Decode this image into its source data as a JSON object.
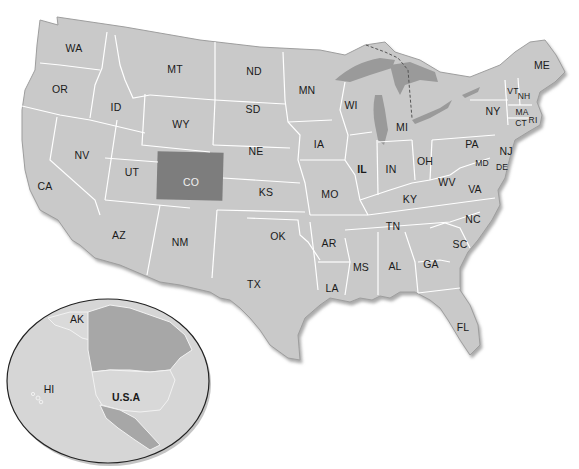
{
  "map": {
    "title": "United States of America",
    "highlighted_state": "CO",
    "colors": {
      "land": "#c9c9c9",
      "highlight": "#7d7d7d",
      "water_lakes": "#9a9a9a",
      "state_border": "#ffffff",
      "coast_shadow": "#a8a8a8",
      "canada": "#a7a7a7",
      "inset_ocean": "#d6d6d6",
      "inset_usa": "#d8d8d8",
      "inset_border": "#222222"
    },
    "states": [
      {
        "abbr": "WA",
        "x": 74,
        "y": 48
      },
      {
        "abbr": "OR",
        "x": 60,
        "y": 89
      },
      {
        "abbr": "ID",
        "x": 116,
        "y": 107
      },
      {
        "abbr": "MT",
        "x": 175,
        "y": 69
      },
      {
        "abbr": "WY",
        "x": 181,
        "y": 124
      },
      {
        "abbr": "NV",
        "x": 82,
        "y": 155
      },
      {
        "abbr": "UT",
        "x": 132,
        "y": 172
      },
      {
        "abbr": "CA",
        "x": 45,
        "y": 186
      },
      {
        "abbr": "AZ",
        "x": 119,
        "y": 235
      },
      {
        "abbr": "NM",
        "x": 180,
        "y": 242
      },
      {
        "abbr": "CO",
        "x": 191,
        "y": 182
      },
      {
        "abbr": "ND",
        "x": 254,
        "y": 71
      },
      {
        "abbr": "SD",
        "x": 253,
        "y": 109
      },
      {
        "abbr": "NE",
        "x": 256,
        "y": 151
      },
      {
        "abbr": "KS",
        "x": 266,
        "y": 192
      },
      {
        "abbr": "OK",
        "x": 278,
        "y": 236
      },
      {
        "abbr": "TX",
        "x": 254,
        "y": 284
      },
      {
        "abbr": "MN",
        "x": 307,
        "y": 90
      },
      {
        "abbr": "IA",
        "x": 319,
        "y": 144
      },
      {
        "abbr": "MO",
        "x": 330,
        "y": 194
      },
      {
        "abbr": "AR",
        "x": 329,
        "y": 243
      },
      {
        "abbr": "LA",
        "x": 332,
        "y": 288
      },
      {
        "abbr": "WI",
        "x": 351,
        "y": 105
      },
      {
        "abbr": "IL",
        "x": 362,
        "y": 169,
        "bold": true
      },
      {
        "abbr": "MI",
        "x": 402,
        "y": 127
      },
      {
        "abbr": "IN",
        "x": 391,
        "y": 169
      },
      {
        "abbr": "OH",
        "x": 425,
        "y": 161
      },
      {
        "abbr": "KY",
        "x": 410,
        "y": 199
      },
      {
        "abbr": "TN",
        "x": 393,
        "y": 226
      },
      {
        "abbr": "MS",
        "x": 361,
        "y": 267
      },
      {
        "abbr": "AL",
        "x": 395,
        "y": 266
      },
      {
        "abbr": "GA",
        "x": 431,
        "y": 264
      },
      {
        "abbr": "FL",
        "x": 463,
        "y": 327
      },
      {
        "abbr": "SC",
        "x": 460,
        "y": 244
      },
      {
        "abbr": "NC",
        "x": 473,
        "y": 219
      },
      {
        "abbr": "VA",
        "x": 475,
        "y": 189
      },
      {
        "abbr": "WV",
        "x": 447,
        "y": 182
      },
      {
        "abbr": "PA",
        "x": 472,
        "y": 144
      },
      {
        "abbr": "NY",
        "x": 493,
        "y": 111
      },
      {
        "abbr": "NJ",
        "x": 506,
        "y": 151
      },
      {
        "abbr": "MD",
        "x": 482,
        "y": 163,
        "small": true
      },
      {
        "abbr": "DE",
        "x": 502,
        "y": 167,
        "small": true
      },
      {
        "abbr": "ME",
        "x": 542,
        "y": 65
      },
      {
        "abbr": "VT",
        "x": 513,
        "y": 91,
        "small": true
      },
      {
        "abbr": "NH",
        "x": 524,
        "y": 96,
        "small": true
      },
      {
        "abbr": "MA",
        "x": 522,
        "y": 112,
        "small": true
      },
      {
        "abbr": "CT",
        "x": 521,
        "y": 123,
        "small": true
      },
      {
        "abbr": "RI",
        "x": 533,
        "y": 120,
        "small": true
      }
    ],
    "inset": {
      "labels": [
        {
          "text": "AK",
          "x": 77,
          "y": 319
        },
        {
          "text": "HI",
          "x": 49,
          "y": 389
        },
        {
          "text": "U.S.A",
          "x": 126,
          "y": 397,
          "bold": true
        }
      ]
    }
  }
}
